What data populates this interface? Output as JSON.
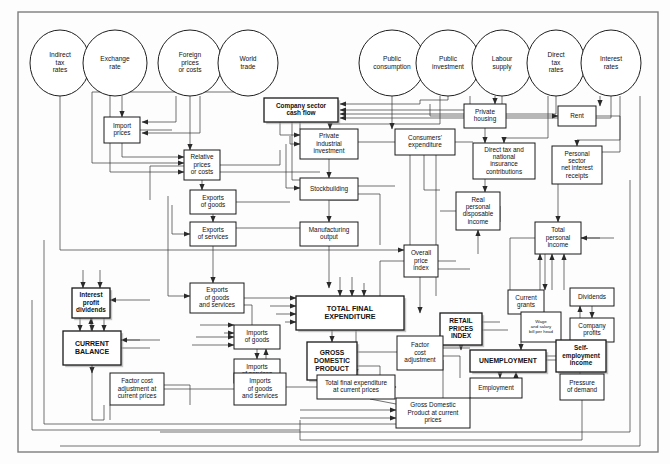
{
  "diagram": {
    "type": "flow-diagram",
    "frame": {
      "x": 18,
      "y": 12,
      "w": 640,
      "h": 440,
      "stroke": "#7d7d7d"
    },
    "colors": {
      "background": "#fdfdfd",
      "box_stroke": "#1a1a1a",
      "box_fill": "#ffffff",
      "emphasis_shadow": "#9a9a9a",
      "line": "#333333",
      "frame": "#7d7d7d"
    },
    "exogenous_inputs": [
      {
        "id": "indirect_tax_rates",
        "label": "Indirect\ntax\nrates",
        "cx": 60,
        "cy": 63,
        "rx": 30,
        "ry": 33
      },
      {
        "id": "exchange_rate",
        "label": "Exchange\nrate",
        "cx": 115,
        "cy": 63,
        "rx": 32,
        "ry": 33
      },
      {
        "id": "foreign_prices_or_costs",
        "label": "Foreign\nprices\nor costs",
        "cx": 190,
        "cy": 63,
        "rx": 32,
        "ry": 33
      },
      {
        "id": "world_trade",
        "label": "World\ntrade",
        "cx": 248,
        "cy": 63,
        "rx": 30,
        "ry": 33
      },
      {
        "id": "public_consumption",
        "label": "Public\nconsumption",
        "cx": 392,
        "cy": 63,
        "rx": 33,
        "ry": 33
      },
      {
        "id": "public_investment",
        "label": "Public\ninvestment",
        "cx": 448,
        "cy": 63,
        "rx": 32,
        "ry": 33
      },
      {
        "id": "labour_supply",
        "label": "Labour\nsupply",
        "cx": 502,
        "cy": 63,
        "rx": 30,
        "ry": 33
      },
      {
        "id": "direct_tax_rates",
        "label": "Direct\ntax\nrates",
        "cx": 556,
        "cy": 63,
        "rx": 29,
        "ry": 33
      },
      {
        "id": "interest_rates",
        "label": "Interest\nrates",
        "cx": 611,
        "cy": 63,
        "rx": 30,
        "ry": 33
      }
    ],
    "nodes": [
      {
        "id": "company_sector_cash_flow",
        "label": "Company sector\ncash flow",
        "x": 264,
        "y": 98,
        "w": 74,
        "h": 24,
        "emphasis": true,
        "fontsize": 6.4
      },
      {
        "id": "private_housing",
        "label": "Private\nhousing",
        "x": 464,
        "y": 104,
        "w": 42,
        "h": 24,
        "emphasis": false,
        "fontsize": 6.4
      },
      {
        "id": "rent",
        "label": "Rent",
        "x": 558,
        "y": 106,
        "w": 38,
        "h": 20,
        "emphasis": false,
        "fontsize": 6.4
      },
      {
        "id": "import_prices",
        "label": "Import\nprices",
        "x": 104,
        "y": 117,
        "w": 36,
        "h": 26,
        "emphasis": false,
        "fontsize": 6.4
      },
      {
        "id": "private_industrial_investment",
        "label": "Private\nindustrial\ninvestment",
        "x": 300,
        "y": 129,
        "w": 58,
        "h": 30,
        "emphasis": false,
        "fontsize": 6.4
      },
      {
        "id": "consumers_expenditure",
        "label": "Consumers'\nexpenditure",
        "x": 395,
        "y": 129,
        "w": 60,
        "h": 26,
        "emphasis": false,
        "fontsize": 6.4
      },
      {
        "id": "relative_prices_or_costs",
        "label": "Relative\nprices\nor costs",
        "x": 184,
        "y": 150,
        "w": 36,
        "h": 30,
        "emphasis": false,
        "fontsize": 6.4
      },
      {
        "id": "direct_tax_and_nic",
        "label": "Direct tax and\nnational\ninsurance\ncontributions",
        "x": 473,
        "y": 143,
        "w": 62,
        "h": 36,
        "emphasis": false,
        "fontsize": 6.4
      },
      {
        "id": "personal_sector_net_interest_receipts",
        "label": "Personal\nsector\nnet interest\nreceipts",
        "x": 552,
        "y": 146,
        "w": 50,
        "h": 38,
        "emphasis": false,
        "fontsize": 6.4
      },
      {
        "id": "stockbuilding",
        "label": "Stockbuilding",
        "x": 300,
        "y": 178,
        "w": 58,
        "h": 22,
        "emphasis": false,
        "fontsize": 6.4
      },
      {
        "id": "exports_of_goods",
        "label": "Exports\nof goods",
        "x": 190,
        "y": 190,
        "w": 46,
        "h": 24,
        "emphasis": false,
        "fontsize": 6.4
      },
      {
        "id": "real_personal_disposable_income",
        "label": "Real\npersonal\ndisposable\nincome",
        "x": 456,
        "y": 192,
        "w": 44,
        "h": 38,
        "emphasis": false,
        "fontsize": 6.4
      },
      {
        "id": "manufacturing_output",
        "label": "Manufacturing\noutput",
        "x": 300,
        "y": 222,
        "w": 58,
        "h": 24,
        "emphasis": false,
        "fontsize": 6.4
      },
      {
        "id": "exports_of_services",
        "label": "Exports\nof services",
        "x": 190,
        "y": 222,
        "w": 46,
        "h": 24,
        "emphasis": false,
        "fontsize": 6.4
      },
      {
        "id": "total_personal_income",
        "label": "Total\npersonal\nincome",
        "x": 535,
        "y": 222,
        "w": 46,
        "h": 32,
        "emphasis": false,
        "fontsize": 6.4
      },
      {
        "id": "overall_price_index",
        "label": "Overall\nprice\nindex",
        "x": 404,
        "y": 245,
        "w": 34,
        "h": 32,
        "emphasis": false,
        "fontsize": 6.4
      },
      {
        "id": "exports_of_goods_and_services",
        "label": "Exports\nof goods\nand services",
        "x": 190,
        "y": 283,
        "w": 54,
        "h": 30,
        "emphasis": false,
        "fontsize": 6.4
      },
      {
        "id": "interest_profit_dividends",
        "label": "Interest\nprofit\ndividends",
        "x": 72,
        "y": 288,
        "w": 38,
        "h": 30,
        "emphasis": true,
        "fontsize": 6.4
      },
      {
        "id": "dividends",
        "label": "Dividends",
        "x": 570,
        "y": 288,
        "w": 44,
        "h": 18,
        "emphasis": false,
        "fontsize": 6.4
      },
      {
        "id": "current_grants",
        "label": "Current\ngrants",
        "x": 508,
        "y": 290,
        "w": 36,
        "h": 24,
        "emphasis": false,
        "fontsize": 6.4
      },
      {
        "id": "total_final_expenditure",
        "label": "TOTAL FINAL\nEXPENDITURE",
        "x": 296,
        "y": 296,
        "w": 108,
        "h": 34,
        "emphasis": true,
        "fontsize": 7.2
      },
      {
        "id": "imports_of_goods",
        "label": "Imports\nof goods",
        "x": 234,
        "y": 325,
        "w": 46,
        "h": 24,
        "emphasis": false,
        "fontsize": 6.4
      },
      {
        "id": "retail_prices_index",
        "label": "RETAIL\nPRICES\nINDEX",
        "x": 440,
        "y": 313,
        "w": 42,
        "h": 32,
        "emphasis": true,
        "fontsize": 6.6
      },
      {
        "id": "company_profits",
        "label": "Company\nprofits",
        "x": 570,
        "y": 318,
        "w": 44,
        "h": 24,
        "emphasis": false,
        "fontsize": 6.4
      },
      {
        "id": "wage_and_salary_bill_per_head",
        "label": "Wage\nand salary\nbill per head",
        "x": 521,
        "y": 312,
        "w": 40,
        "h": 30,
        "emphasis": false,
        "fontsize": 4.4
      },
      {
        "id": "current_balance",
        "label": "CURRENT\nBALANCE",
        "x": 63,
        "y": 331,
        "w": 58,
        "h": 34,
        "emphasis": true,
        "fontsize": 7.0
      },
      {
        "id": "imports_of_services",
        "label": "Imports\nof services",
        "x": 234,
        "y": 359,
        "w": 46,
        "h": 24,
        "emphasis": false,
        "fontsize": 6.4
      },
      {
        "id": "gross_domestic_product",
        "label": "GROSS\nDOMESTIC\nPRODUCT",
        "x": 307,
        "y": 342,
        "w": 50,
        "h": 38,
        "emphasis": true,
        "fontsize": 6.8
      },
      {
        "id": "factor_cost_adjustment",
        "label": "Factor\ncost\nadjustment",
        "x": 397,
        "y": 336,
        "w": 46,
        "h": 34,
        "emphasis": false,
        "fontsize": 6.4
      },
      {
        "id": "self_employment_income",
        "label": "Self-\nemployment\nincome",
        "x": 556,
        "y": 340,
        "w": 50,
        "h": 32,
        "emphasis": true,
        "fontsize": 6.4
      },
      {
        "id": "unemployment",
        "label": "UNEMPLOYMENT",
        "x": 470,
        "y": 350,
        "w": 76,
        "h": 22,
        "emphasis": true,
        "fontsize": 6.8
      },
      {
        "id": "factor_cost_adjustment_current_prices",
        "label": "Factor cost\nadjustment at\ncurrent prices",
        "x": 110,
        "y": 373,
        "w": 54,
        "h": 32,
        "emphasis": false,
        "fontsize": 6.4
      },
      {
        "id": "imports_of_goods_and_services",
        "label": "Imports\nof goods\nand services",
        "x": 234,
        "y": 373,
        "w": 52,
        "h": 32,
        "emphasis": false,
        "fontsize": 6.4
      },
      {
        "id": "total_final_expenditure_current_prices",
        "label": "Total final expenditure\nat current prices",
        "x": 317,
        "y": 375,
        "w": 78,
        "h": 24,
        "emphasis": false,
        "fontsize": 6.4
      },
      {
        "id": "employment",
        "label": "Employment",
        "x": 470,
        "y": 378,
        "w": 52,
        "h": 20,
        "emphasis": false,
        "fontsize": 6.4
      },
      {
        "id": "pressure_of_demand",
        "label": "Pressure\nof demand",
        "x": 560,
        "y": 374,
        "w": 44,
        "h": 26,
        "emphasis": false,
        "fontsize": 6.4
      },
      {
        "id": "gross_domestic_product_current_prices",
        "label": "Gross Domestic\nProduct at current\nprices",
        "x": 396,
        "y": 398,
        "w": 74,
        "h": 30,
        "emphasis": false,
        "fontsize": 6.4
      }
    ]
  }
}
